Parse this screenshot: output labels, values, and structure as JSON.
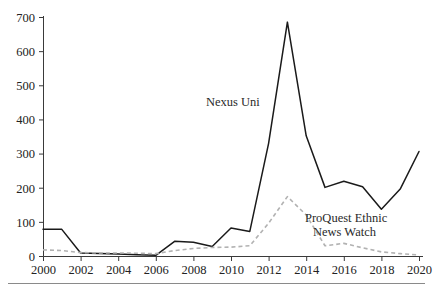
{
  "chart_data": {
    "type": "line",
    "title": "",
    "subtitle": "",
    "xlabel": "",
    "ylabel": "",
    "x": [
      2000,
      2001,
      2002,
      2003,
      2004,
      2005,
      2006,
      2007,
      2008,
      2009,
      2010,
      2011,
      2012,
      2013,
      2014,
      2015,
      2016,
      2017,
      2018,
      2019,
      2020
    ],
    "xlim": [
      2000,
      2020
    ],
    "ylim": [
      0,
      700
    ],
    "x_tick_labels": [
      "2000",
      "2002",
      "2004",
      "2006",
      "2008",
      "2010",
      "2012",
      "2014",
      "2016",
      "2018",
      "2020"
    ],
    "x_tick_values": [
      2000,
      2002,
      2004,
      2006,
      2008,
      2010,
      2012,
      2014,
      2016,
      2018,
      2020
    ],
    "y_tick_labels": [
      "0",
      "100",
      "200",
      "300",
      "400",
      "500",
      "600",
      "700"
    ],
    "y_tick_values": [
      0,
      100,
      200,
      300,
      400,
      500,
      600,
      700
    ],
    "grid": false,
    "legend_position": "inline-annotations",
    "series": [
      {
        "name": "Nexus Uni",
        "style": "solid",
        "color": "#1a1a1a",
        "values": [
          78,
          78,
          9,
          7,
          6,
          4,
          2,
          43,
          40,
          28,
          82,
          72,
          330,
          685,
          352,
          201,
          219,
          203,
          137,
          196,
          306
        ]
      },
      {
        "name": "ProQuest Ethnic News Watch",
        "style": "dashed",
        "color": "#b2b2b2",
        "values": [
          18,
          16,
          10,
          9,
          9,
          8,
          7,
          16,
          22,
          25,
          26,
          30,
          96,
          174,
          120,
          30,
          37,
          24,
          12,
          7,
          3
        ]
      }
    ],
    "annotations": [
      {
        "text": "Nexus Uni",
        "x_px": 206,
        "y_px": 106,
        "anchor": "start"
      },
      {
        "text": "ProQuest Ethnic",
        "x_px": 305,
        "y_px": 222,
        "anchor": "start"
      },
      {
        "text": "News Watch",
        "x_px": 313,
        "y_px": 236,
        "anchor": "start"
      }
    ]
  }
}
